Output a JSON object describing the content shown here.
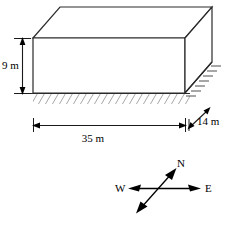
{
  "figure": {
    "dimensions": {
      "height": {
        "label": "9 m",
        "value": 9,
        "unit": "m",
        "orientation": "vertical"
      },
      "length": {
        "label": "35 m",
        "value": 35,
        "unit": "m",
        "orientation": "horizontal"
      },
      "depth": {
        "label": "14 m",
        "value": 14,
        "unit": "m",
        "orientation": "diagonal"
      }
    },
    "compass": {
      "north_label": "N",
      "west_label": "W",
      "east_label": "E"
    },
    "colors": {
      "line": "#2a2a2a",
      "hatch": "#3a3a3a",
      "text": "#000000",
      "background": "#ffffff"
    }
  }
}
